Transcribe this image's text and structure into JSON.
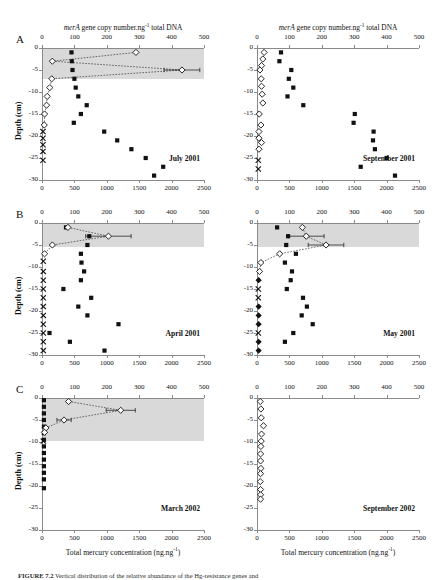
{
  "figure": {
    "caption_prefix": "FIGURE 7.2",
    "caption_text": "   Vertical distribution of the relative abundance of the Hg-resistance genes and",
    "panel_letters": [
      "A",
      "B",
      "C"
    ],
    "top_axis_title_pre": "merA",
    "top_axis_title_post": " gene copy number.ng",
    "top_axis_title_sup": "-1",
    "top_axis_title_end": " total DNA",
    "y_axis_label": "Depth (cm)",
    "bottom_axis_label_pre": "Total mercury concentration (ng.ng",
    "bottom_axis_label_sup": "-1",
    "bottom_axis_label_end": ")",
    "top_ticks": [
      0,
      100,
      200,
      300,
      400,
      500
    ],
    "bottom_ticks": [
      0,
      500,
      1000,
      1500,
      2000,
      2500
    ],
    "depth_ticks": [
      0,
      -5,
      -10,
      -15,
      -20,
      -25,
      -30
    ],
    "colors": {
      "shade": "#d9d9d9",
      "axis": "#8a8a8a",
      "marker": "#111111",
      "text": "#111111"
    }
  },
  "chart_data": [
    {
      "type": "scatter",
      "panel": "A",
      "title": "July 2001",
      "xlabel_top": "merA gene copy number.ng-1 total DNA",
      "xlabel_bottom": "Total mercury concentration (ng.ng-1)",
      "ylabel": "Depth (cm)",
      "xlim_top": [
        0,
        500
      ],
      "xlim_bottom": [
        0,
        2500
      ],
      "ylim": [
        -30,
        0
      ],
      "grid": false,
      "shade_depth_range": [
        0,
        -7
      ],
      "series": [
        {
          "name": "Total mercury (filled square)",
          "marker": "filled-square",
          "axis": "bottom",
          "points": [
            {
              "x": 455,
              "y": -1
            },
            {
              "x": 460,
              "y": -3
            },
            {
              "x": 470,
              "y": -5
            },
            {
              "x": 500,
              "y": -7
            },
            {
              "x": 520,
              "y": -9
            },
            {
              "x": 560,
              "y": -11
            },
            {
              "x": 690,
              "y": -13
            },
            {
              "x": 600,
              "y": -15
            },
            {
              "x": 490,
              "y": -17
            },
            {
              "x": 960,
              "y": -19
            },
            {
              "x": 1160,
              "y": -21
            },
            {
              "x": 1380,
              "y": -23
            },
            {
              "x": 1600,
              "y": -25
            },
            {
              "x": 1870,
              "y": -27
            },
            {
              "x": 1730,
              "y": -29
            }
          ]
        },
        {
          "name": "merA gene copies (open diamond)",
          "marker": "open-diamond",
          "axis": "top",
          "connected": true,
          "points": [
            {
              "x": 290,
              "y": -1,
              "err": 0
            },
            {
              "x": 32,
              "y": -3,
              "err": 0
            },
            {
              "x": 432,
              "y": -5,
              "err": 55
            },
            {
              "x": 30,
              "y": -7,
              "err": 0
            },
            {
              "x": 24,
              "y": -9,
              "err": 0
            },
            {
              "x": 16,
              "y": -11,
              "err": 0
            },
            {
              "x": 14,
              "y": -13,
              "err": 0
            },
            {
              "x": 8,
              "y": -15,
              "err": 0
            },
            {
              "x": 7,
              "y": -17.5,
              "err": 0
            }
          ]
        },
        {
          "name": "below detection (cross)",
          "marker": "cross",
          "axis": "top",
          "points": [
            {
              "x": 3,
              "y": -19
            },
            {
              "x": 3,
              "y": -20.5
            },
            {
              "x": 3,
              "y": -22
            },
            {
              "x": 3,
              "y": -23.5
            },
            {
              "x": 3,
              "y": -25.5
            }
          ]
        }
      ]
    },
    {
      "type": "scatter",
      "panel": "A",
      "title": "September 2001",
      "xlim_top": [
        0,
        500
      ],
      "xlim_bottom": [
        0,
        2500
      ],
      "ylim": [
        -30,
        0
      ],
      "grid": false,
      "shade_depth_range": null,
      "series": [
        {
          "name": "Total mercury (filled square)",
          "marker": "filled-square",
          "axis": "bottom",
          "points": [
            {
              "x": 370,
              "y": -1
            },
            {
              "x": 345,
              "y": -3
            },
            {
              "x": 530,
              "y": -5
            },
            {
              "x": 490,
              "y": -7
            },
            {
              "x": 560,
              "y": -9
            },
            {
              "x": 470,
              "y": -11
            },
            {
              "x": 715,
              "y": -13
            },
            {
              "x": 1510,
              "y": -15
            },
            {
              "x": 1490,
              "y": -17
            },
            {
              "x": 1800,
              "y": -19
            },
            {
              "x": 1790,
              "y": -21
            },
            {
              "x": 1820,
              "y": -23
            },
            {
              "x": 2000,
              "y": -25
            },
            {
              "x": 1600,
              "y": -27
            },
            {
              "x": 2130,
              "y": -29
            }
          ]
        },
        {
          "name": "merA gene copies (open diamond)",
          "marker": "open-diamond",
          "axis": "top",
          "connected": false,
          "points": [
            {
              "x": 22,
              "y": -1,
              "err": 0
            },
            {
              "x": 18,
              "y": -2.5,
              "err": 0
            },
            {
              "x": 14,
              "y": -4,
              "err": 0
            },
            {
              "x": 9,
              "y": -5,
              "err": 0
            },
            {
              "x": 13,
              "y": -7,
              "err": 0
            },
            {
              "x": 14,
              "y": -8.7,
              "err": 0
            },
            {
              "x": 16,
              "y": -10.5,
              "err": 0
            },
            {
              "x": 18,
              "y": -12.5,
              "err": 0
            },
            {
              "x": 7,
              "y": -15,
              "err": 0
            },
            {
              "x": 12,
              "y": -17.5,
              "err": 0
            },
            {
              "x": 6,
              "y": -19,
              "err": 0
            },
            {
              "x": 6,
              "y": -20.5,
              "err": 0
            },
            {
              "x": 14,
              "y": -21.5,
              "err": 0
            },
            {
              "x": 6,
              "y": -23,
              "err": 0
            }
          ]
        },
        {
          "name": "below detection (cross)",
          "marker": "cross",
          "axis": "top",
          "points": [
            {
              "x": 4,
              "y": -25.5
            },
            {
              "x": 4,
              "y": -27.5
            }
          ]
        }
      ]
    },
    {
      "type": "scatter",
      "panel": "B",
      "title": "April 2001",
      "xlim_top": [
        0,
        500
      ],
      "xlim_bottom": [
        0,
        2500
      ],
      "ylim": [
        -30,
        0
      ],
      "grid": false,
      "shade_depth_range": [
        0,
        -5.5
      ],
      "series": [
        {
          "name": "Total mercury (filled square)",
          "marker": "filled-square",
          "axis": "bottom",
          "points": [
            {
              "x": 370,
              "y": -1
            },
            {
              "x": 730,
              "y": -3
            },
            {
              "x": 700,
              "y": -5
            },
            {
              "x": 600,
              "y": -7
            },
            {
              "x": 610,
              "y": -9
            },
            {
              "x": 650,
              "y": -11
            },
            {
              "x": 600,
              "y": -13
            },
            {
              "x": 330,
              "y": -15
            },
            {
              "x": 760,
              "y": -17
            },
            {
              "x": 560,
              "y": -19
            },
            {
              "x": 700,
              "y": -21
            },
            {
              "x": 1180,
              "y": -23
            },
            {
              "x": 115,
              "y": -25
            },
            {
              "x": 430,
              "y": -27
            },
            {
              "x": 965,
              "y": -29
            }
          ]
        },
        {
          "name": "merA gene copies (open diamond)",
          "marker": "open-diamond",
          "axis": "top",
          "connected": true,
          "points": [
            {
              "x": 80,
              "y": -1,
              "err": 0
            },
            {
              "x": 205,
              "y": -3,
              "err": 70
            },
            {
              "x": 32,
              "y": -5,
              "err": 0
            },
            {
              "x": 8,
              "y": -7,
              "err": 0
            }
          ]
        },
        {
          "name": "below detection (cross)",
          "marker": "cross",
          "axis": "top",
          "points": [
            {
              "x": 4,
              "y": -8.7
            },
            {
              "x": 4,
              "y": -11
            },
            {
              "x": 4,
              "y": -13
            },
            {
              "x": 4,
              "y": -15
            },
            {
              "x": 4,
              "y": -17
            },
            {
              "x": 4,
              "y": -19
            },
            {
              "x": 4,
              "y": -21
            },
            {
              "x": 4,
              "y": -23
            },
            {
              "x": 4,
              "y": -25
            },
            {
              "x": 4,
              "y": -27
            },
            {
              "x": 4,
              "y": -29
            }
          ]
        }
      ]
    },
    {
      "type": "scatter",
      "panel": "B",
      "title": "May 2001",
      "xlim_top": [
        0,
        500
      ],
      "xlim_bottom": [
        0,
        2500
      ],
      "ylim": [
        -30,
        0
      ],
      "grid": false,
      "shade_depth_range": [
        0,
        -5.5
      ],
      "series": [
        {
          "name": "Total mercury (filled square)",
          "marker": "filled-square",
          "axis": "bottom",
          "points": [
            {
              "x": 310,
              "y": -1
            },
            {
              "x": 480,
              "y": -3
            },
            {
              "x": 450,
              "y": -5
            },
            {
              "x": 600,
              "y": -7
            },
            {
              "x": 430,
              "y": -9
            },
            {
              "x": 540,
              "y": -11
            },
            {
              "x": 520,
              "y": -13
            },
            {
              "x": 460,
              "y": -15
            },
            {
              "x": 710,
              "y": -17
            },
            {
              "x": 770,
              "y": -19
            },
            {
              "x": 690,
              "y": -21
            },
            {
              "x": 860,
              "y": -23
            },
            {
              "x": 560,
              "y": -25
            },
            {
              "x": 430,
              "y": -27
            }
          ]
        },
        {
          "name": "merA gene copies (open diamond)",
          "marker": "open-diamond",
          "axis": "top",
          "connected": true,
          "points": [
            {
              "x": 140,
              "y": -1,
              "err": 0
            },
            {
              "x": 152,
              "y": -3,
              "err": 55
            },
            {
              "x": 213,
              "y": -5,
              "err": 55
            },
            {
              "x": 70,
              "y": -7,
              "err": 0
            },
            {
              "x": 12,
              "y": -9,
              "err": 0
            },
            {
              "x": 8,
              "y": -11,
              "err": 0
            }
          ]
        },
        {
          "name": "below detection (cross)",
          "marker": "cross",
          "axis": "top",
          "points": [
            {
              "x": 4,
              "y": -15
            },
            {
              "x": 4,
              "y": -17
            },
            {
              "x": 4,
              "y": -25
            }
          ]
        },
        {
          "name": "merA filled diamond",
          "marker": "filled-diamond",
          "axis": "top",
          "points": [
            {
              "x": 5,
              "y": -13
            },
            {
              "x": 5,
              "y": -19
            },
            {
              "x": 5,
              "y": -21
            },
            {
              "x": 5,
              "y": -23
            },
            {
              "x": 5,
              "y": -27
            },
            {
              "x": 5,
              "y": -29
            }
          ]
        }
      ]
    },
    {
      "type": "scatter",
      "panel": "C",
      "title": "March 2002",
      "xlim_top": [
        0,
        500
      ],
      "xlim_bottom": [
        0,
        2500
      ],
      "ylim": [
        -30,
        0
      ],
      "grid": false,
      "shade_depth_range": [
        0,
        -9.7
      ],
      "series": [
        {
          "name": "Total mercury (filled square)",
          "marker": "filled-square",
          "axis": "bottom",
          "points": [
            {
              "x": 30,
              "y": -0.5
            },
            {
              "x": 30,
              "y": -2
            },
            {
              "x": 30,
              "y": -3.5
            },
            {
              "x": 30,
              "y": -5
            },
            {
              "x": 30,
              "y": -6.5
            },
            {
              "x": 30,
              "y": -8
            },
            {
              "x": 30,
              "y": -9.5
            },
            {
              "x": 30,
              "y": -11
            },
            {
              "x": 30,
              "y": -12.5
            },
            {
              "x": 30,
              "y": -14
            },
            {
              "x": 30,
              "y": -15.5
            },
            {
              "x": 30,
              "y": -17
            },
            {
              "x": 30,
              "y": -18.5
            },
            {
              "x": 30,
              "y": -20.5
            }
          ]
        },
        {
          "name": "merA gene copies (open diamond)",
          "marker": "open-diamond",
          "axis": "top",
          "connected": true,
          "points": [
            {
              "x": 82,
              "y": -0.8,
              "err": 0
            },
            {
              "x": 243,
              "y": -2.8,
              "err": 45
            },
            {
              "x": 68,
              "y": -5,
              "err": 22
            },
            {
              "x": 12,
              "y": -6.8,
              "err": 0
            },
            {
              "x": 8,
              "y": -7.8,
              "err": 0
            }
          ]
        },
        {
          "name": "below detection (cross)",
          "marker": "cross",
          "axis": "top",
          "points": [
            {
              "x": 4,
              "y": -9.8
            }
          ]
        }
      ]
    },
    {
      "type": "scatter",
      "panel": "C",
      "title": "September 2002",
      "xlim_top": [
        0,
        500
      ],
      "xlim_bottom": [
        0,
        2500
      ],
      "ylim": [
        -30,
        0
      ],
      "grid": false,
      "shade_depth_range": null,
      "series": [
        {
          "name": "merA gene copies (open diamond)",
          "marker": "open-diamond",
          "axis": "top",
          "connected": false,
          "points": [
            {
              "x": 10,
              "y": -0.8,
              "err": 0
            },
            {
              "x": 12,
              "y": -2.5,
              "err": 0
            },
            {
              "x": 13,
              "y": -4.5,
              "err": 0
            },
            {
              "x": 20,
              "y": -6.3,
              "err": 0
            },
            {
              "x": 14,
              "y": -8.2,
              "err": 0
            },
            {
              "x": 13,
              "y": -9.8,
              "err": 0
            },
            {
              "x": 12,
              "y": -11,
              "err": 0
            },
            {
              "x": 11,
              "y": -12.7,
              "err": 0
            },
            {
              "x": 11,
              "y": -14.3,
              "err": 0
            },
            {
              "x": 12,
              "y": -16,
              "err": 0
            },
            {
              "x": 11,
              "y": -17.2,
              "err": 0
            },
            {
              "x": 10,
              "y": -19,
              "err": 0
            },
            {
              "x": 11,
              "y": -20.8,
              "err": 0
            },
            {
              "x": 11,
              "y": -22,
              "err": 0
            },
            {
              "x": 11,
              "y": -23,
              "err": 0
            }
          ]
        }
      ]
    }
  ]
}
